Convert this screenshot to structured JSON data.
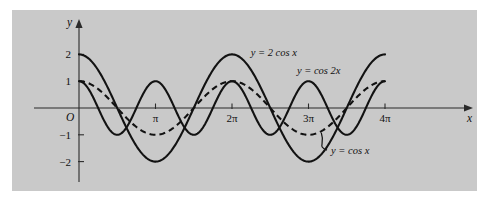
{
  "figure": {
    "panel_background": "#c9c9c9",
    "page_background": "#ffffff",
    "ink_color": "#121212"
  },
  "axes": {
    "y_axis_label": "y",
    "x_axis_label": "x",
    "origin_label": "O",
    "y_ticks": [
      {
        "value": 2,
        "label": "2"
      },
      {
        "value": 1,
        "label": "1"
      },
      {
        "value": -1,
        "label": "−1"
      },
      {
        "value": -2,
        "label": "−2"
      }
    ],
    "x_ticks": [
      {
        "value": 3.14159265,
        "label": "π"
      },
      {
        "value": 6.28318531,
        "label": "2π"
      },
      {
        "value": 9.42477796,
        "label": "3π"
      },
      {
        "value": 12.5663706,
        "label": "4π"
      }
    ]
  },
  "curve_labels": {
    "two_cos_x": "y = 2 cos x",
    "cos_two_x": "y = cos 2x",
    "cos_x": "y = cos x"
  },
  "chart_data": {
    "type": "line",
    "title": "",
    "xlabel": "x",
    "ylabel": "y",
    "xlim": [
      -0.55,
      14.0
    ],
    "ylim": [
      -2.7,
      2.7
    ],
    "grid": false,
    "legend": "inline-annotations",
    "xtick_values": [
      3.14159265,
      6.28318531,
      9.42477796,
      12.5663706
    ],
    "xtick_labels": [
      "π",
      "2π",
      "3π",
      "4π"
    ],
    "ytick_values": [
      2,
      1,
      -1,
      -2
    ],
    "ytick_labels": [
      "2",
      "1",
      "−1",
      "−2"
    ],
    "series": [
      {
        "name": "y = 2 cos x",
        "expression": "2*cos(x)",
        "amplitude": 2,
        "period": 6.28318531,
        "style": "solid",
        "x_start": 0,
        "x_end": 12.5663706,
        "maxima_x": [
          0,
          6.28318531,
          12.5663706
        ],
        "maxima_y": 2,
        "minima_x": [
          3.14159265,
          9.42477796
        ],
        "minima_y": -2,
        "zeros_x": [
          1.5707963,
          4.712389,
          7.8539816,
          10.9955743
        ]
      },
      {
        "name": "y = cos 2x",
        "expression": "cos(2*x)",
        "amplitude": 1,
        "period": 3.14159265,
        "style": "solid",
        "x_start": 0,
        "x_end": 12.5663706,
        "maxima_x": [
          0,
          3.14159265,
          6.28318531,
          9.42477796,
          12.5663706
        ],
        "maxima_y": 1,
        "minima_x": [
          1.5707963,
          4.712389,
          7.8539816,
          10.9955743
        ],
        "minima_y": -1,
        "zeros_x": [
          0.7853982,
          2.3561945,
          3.9269908,
          5.4977871,
          7.0685835,
          8.6393798,
          10.2101761,
          11.7809725
        ]
      },
      {
        "name": "y = cos x",
        "expression": "cos(x)",
        "amplitude": 1,
        "period": 6.28318531,
        "style": "dashed",
        "x_start": 0,
        "x_end": 12.5663706,
        "maxima_x": [
          0,
          6.28318531,
          12.5663706
        ],
        "maxima_y": 1,
        "minima_x": [
          3.14159265,
          9.42477796
        ],
        "minima_y": -1,
        "zeros_x": [
          1.5707963,
          4.712389,
          7.8539816,
          10.9955743
        ]
      }
    ],
    "annotations": [
      {
        "text": "y = 2 cos x",
        "x": 7.05,
        "y": 1.95,
        "leader": false
      },
      {
        "text": "y = cos 2x",
        "x": 8.95,
        "y": 1.28,
        "leader": false
      },
      {
        "text": "y = cos x",
        "x": 10.35,
        "y": -1.72,
        "leader": true
      }
    ]
  }
}
